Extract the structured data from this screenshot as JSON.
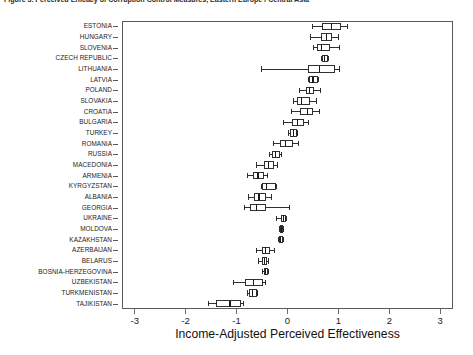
{
  "figure": {
    "caption": "Figure 3. Perceived Efficacy of Corruption Control Measures, Eastern Europe / Central Asia"
  },
  "chart_data": {
    "type": "boxplot",
    "orientation": "horizontal",
    "title": "",
    "xlabel": "Income-Adjusted Perceived Effectiveness",
    "ylabel": "",
    "xlim": [
      -3.25,
      3.25
    ],
    "xticks": [
      -3,
      -2,
      -1,
      0,
      1,
      2,
      3
    ],
    "xticklabels": [
      "-3",
      "-2",
      "-1",
      "0",
      "1",
      "2",
      "3"
    ],
    "grid": false,
    "legend": null,
    "categories": [
      "ESTONIA",
      "HUNGARY",
      "SLOVENIA",
      "CZECH REPUBLIC",
      "LITHUANIA",
      "LATVIA",
      "POLAND",
      "SLOVAKIA",
      "CROATIA",
      "BULGARIA",
      "TURKEY",
      "ROMANIA",
      "RUSSIA",
      "MACEDONIA",
      "ARMENIA",
      "KYRGYZSTAN",
      "ALBANIA",
      "GEORGIA",
      "UKRAINE",
      "MOLDOVA",
      "KAZAKHSTAN",
      "AZERBAIJAN",
      "BELARUS",
      "BOSNIA-HERZEGOVINA",
      "UZBEKISTAN",
      "TURKMENISTAN",
      "TAJIKISTAN"
    ],
    "boxes": [
      {
        "category": "ESTONIA",
        "whisker_low": 0.5,
        "q1": 0.69,
        "median": 0.87,
        "q3": 1.05,
        "whisker_high": 1.17
      },
      {
        "category": "HUNGARY",
        "whisker_low": 0.46,
        "q1": 0.67,
        "median": 0.76,
        "q3": 0.87,
        "whisker_high": 1.01
      },
      {
        "category": "SLOVENIA",
        "whisker_low": 0.52,
        "q1": 0.58,
        "median": 0.67,
        "q3": 0.83,
        "whisker_high": 1.03
      },
      {
        "category": "CZECH REPUBLIC",
        "whisker_low": 0.67,
        "q1": 0.69,
        "median": 0.73,
        "q3": 0.78,
        "whisker_high": 0.8
      },
      {
        "category": "LITHUANIA",
        "whisker_low": -0.52,
        "q1": 0.41,
        "median": 0.63,
        "q3": 0.93,
        "whisker_high": 1.03
      },
      {
        "category": "LATVIA",
        "whisker_low": 0.41,
        "q1": 0.43,
        "median": 0.5,
        "q3": 0.58,
        "whisker_high": 0.6
      },
      {
        "category": "POLAND",
        "whisker_low": 0.24,
        "q1": 0.37,
        "median": 0.43,
        "q3": 0.52,
        "whisker_high": 0.65
      },
      {
        "category": "SLOVAKIA",
        "whisker_low": 0.11,
        "q1": 0.19,
        "median": 0.28,
        "q3": 0.43,
        "whisker_high": 0.56
      },
      {
        "category": "CROATIA",
        "whisker_low": 0.07,
        "q1": 0.26,
        "median": 0.39,
        "q3": 0.5,
        "whisker_high": 0.63
      },
      {
        "category": "BULGARIA",
        "whisker_low": -0.07,
        "q1": 0.09,
        "median": 0.19,
        "q3": 0.32,
        "whisker_high": 0.41
      },
      {
        "category": "TURKEY",
        "whisker_low": 0.02,
        "q1": 0.05,
        "median": 0.11,
        "q3": 0.17,
        "whisker_high": 0.19
      },
      {
        "category": "ROMANIA",
        "whisker_low": -0.28,
        "q1": -0.13,
        "median": -0.04,
        "q3": 0.09,
        "whisker_high": 0.21
      },
      {
        "category": "RUSSIA",
        "whisker_low": -0.35,
        "q1": -0.3,
        "median": -0.24,
        "q3": -0.15,
        "whisker_high": -0.11
      },
      {
        "category": "MACEDONIA",
        "whisker_low": -0.6,
        "q1": -0.46,
        "median": -0.37,
        "q3": -0.28,
        "whisker_high": -0.19
      },
      {
        "category": "ARMENIA",
        "whisker_low": -0.78,
        "q1": -0.67,
        "median": -0.58,
        "q3": -0.48,
        "whisker_high": -0.39
      },
      {
        "category": "KYRGYZSTAN",
        "whisker_low": -0.52,
        "q1": -0.5,
        "median": -0.41,
        "q3": -0.24,
        "whisker_high": -0.22
      },
      {
        "category": "ALBANIA",
        "whisker_low": -0.76,
        "q1": -0.65,
        "median": -0.56,
        "q3": -0.43,
        "whisker_high": -0.32
      },
      {
        "category": "GEORGIA",
        "whisker_low": -0.85,
        "q1": -0.72,
        "median": -0.61,
        "q3": -0.43,
        "whisker_high": 0.04
      },
      {
        "category": "UKRAINE",
        "whisker_low": -0.22,
        "q1": -0.11,
        "median": -0.07,
        "q3": -0.04,
        "whisker_high": -0.02
      },
      {
        "category": "MOLDOVA",
        "whisker_low": -0.15,
        "q1": -0.13,
        "median": -0.11,
        "q3": -0.09,
        "whisker_high": -0.07
      },
      {
        "category": "KAZAKHSTAN",
        "whisker_low": -0.17,
        "q1": -0.15,
        "median": -0.13,
        "q3": -0.09,
        "whisker_high": -0.07
      },
      {
        "category": "AZERBAIJAN",
        "whisker_low": -0.61,
        "q1": -0.5,
        "median": -0.43,
        "q3": -0.35,
        "whisker_high": -0.26
      },
      {
        "category": "BELARUS",
        "whisker_low": -0.56,
        "q1": -0.5,
        "median": -0.46,
        "q3": -0.41,
        "whisker_high": -0.37
      },
      {
        "category": "BOSNIA-HERZEGOVINA",
        "whisker_low": -0.5,
        "q1": -0.46,
        "median": -0.43,
        "q3": -0.39,
        "whisker_high": -0.37
      },
      {
        "category": "UZBEKISTAN",
        "whisker_low": -1.06,
        "q1": -0.83,
        "median": -0.67,
        "q3": -0.5,
        "whisker_high": -0.43
      },
      {
        "category": "TURKMENISTAN",
        "whisker_low": -0.78,
        "q1": -0.74,
        "median": -0.69,
        "q3": -0.61,
        "whisker_high": -0.58
      },
      {
        "category": "TAJIKISTAN",
        "whisker_low": -1.56,
        "q1": -1.39,
        "median": -1.13,
        "q3": -0.93,
        "whisker_high": -0.87
      }
    ]
  }
}
